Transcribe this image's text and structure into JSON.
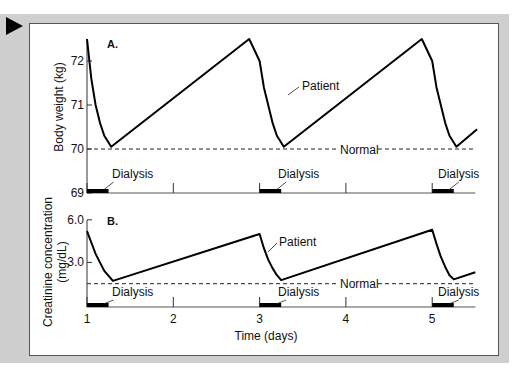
{
  "chart_data": [
    {
      "type": "line",
      "panel_label": "A.",
      "ylabel": "Body weight (kg)",
      "xlabel": "",
      "yticks": [
        69,
        70,
        71,
        72
      ],
      "ylim": [
        69,
        72.5
      ],
      "xlim": [
        1,
        5.5
      ],
      "normal_value": 70,
      "normal_label": "Normal",
      "series_label": "Patient",
      "dialysis_label": "Dialysis",
      "dialysis_periods": [
        [
          1,
          1.25
        ],
        [
          3,
          3.25
        ],
        [
          5,
          5.25
        ]
      ],
      "series": [
        {
          "name": "Patient",
          "x": [
            1.0,
            1.05,
            1.1,
            1.15,
            1.2,
            1.28,
            2.88,
            3.0,
            3.05,
            3.1,
            3.15,
            3.2,
            3.28,
            4.88,
            5.0,
            5.05,
            5.1,
            5.15,
            5.2,
            5.28,
            5.52
          ],
          "y": [
            72.5,
            71.6,
            71.0,
            70.6,
            70.3,
            70.05,
            72.5,
            72.0,
            71.4,
            71.0,
            70.6,
            70.3,
            70.05,
            72.5,
            72.0,
            71.4,
            71.0,
            70.6,
            70.3,
            70.05,
            70.45
          ]
        }
      ]
    },
    {
      "type": "line",
      "panel_label": "B.",
      "ylabel": "Creatinine concentration (mg/dL)",
      "xlabel": "Time (days)",
      "yticks": [
        3.0,
        6.0
      ],
      "ytick_labels": [
        "3.0",
        "6.0"
      ],
      "ylim": [
        0,
        6.0
      ],
      "xlim": [
        1,
        5.5
      ],
      "xticks": [
        1,
        2,
        3,
        4,
        5
      ],
      "normal_value": 1.5,
      "normal_label": "Normal",
      "series_label": "Patient",
      "dialysis_label": "Dialysis",
      "dialysis_periods": [
        [
          1,
          1.25
        ],
        [
          3,
          3.25
        ],
        [
          5,
          5.25
        ]
      ],
      "series": [
        {
          "name": "Patient",
          "x": [
            1.0,
            1.05,
            1.1,
            1.15,
            1.2,
            1.3,
            3.0,
            3.05,
            3.1,
            3.15,
            3.2,
            3.25,
            5.0,
            5.05,
            5.1,
            5.15,
            5.2,
            5.25,
            5.5
          ],
          "y": [
            5.2,
            4.4,
            3.6,
            3.0,
            2.4,
            1.7,
            5.0,
            4.0,
            3.2,
            2.6,
            2.1,
            1.75,
            5.3,
            4.3,
            3.4,
            2.7,
            2.1,
            1.8,
            2.3
          ]
        }
      ]
    }
  ],
  "labels": {
    "panelA": "A.",
    "panelB": "B.",
    "ylabelA": "Body weight (kg)",
    "ylabelB1": "Creatinine concentration",
    "ylabelB2": "(mg/dL)",
    "xlabel": "Time (days)",
    "patient": "Patient",
    "normal": "Normal",
    "dialysis": "Dialysis"
  }
}
